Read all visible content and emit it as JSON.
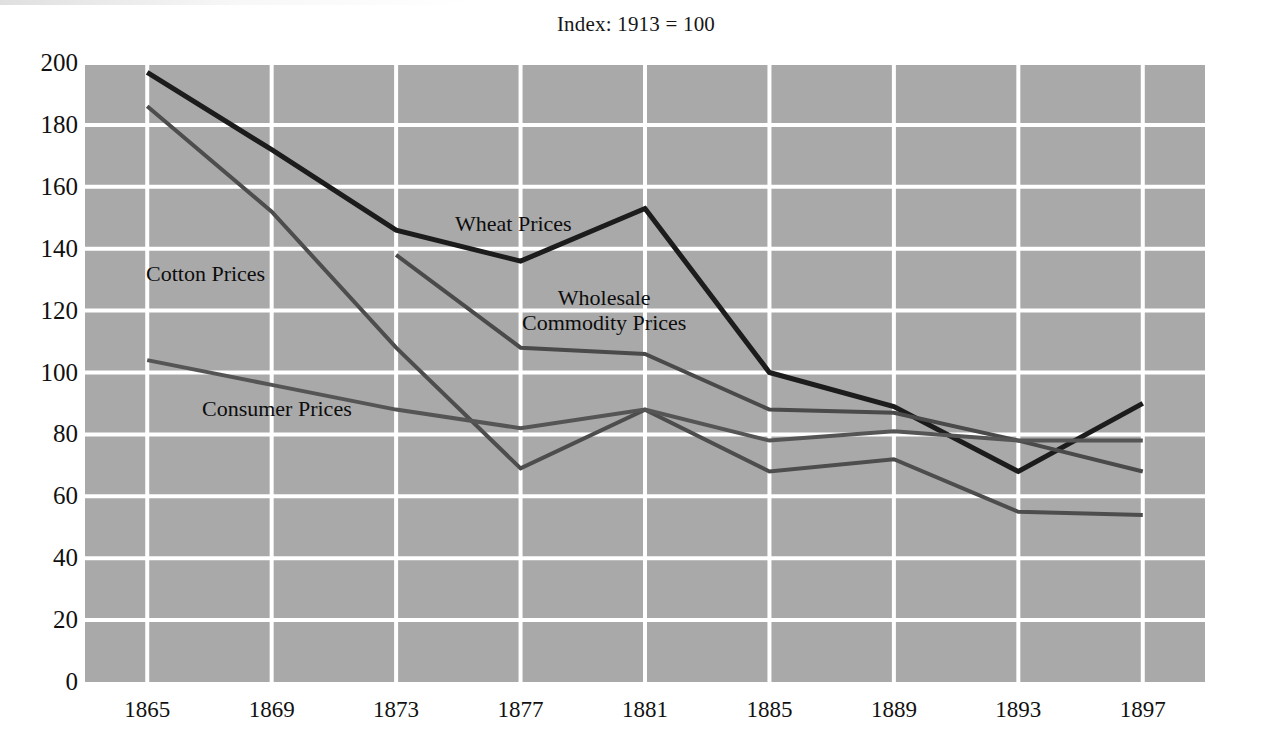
{
  "chart_data": {
    "type": "line",
    "title": "Index: 1913 = 100",
    "xlabel": "",
    "ylabel": "",
    "x": [
      1865,
      1869,
      1873,
      1877,
      1881,
      1885,
      1889,
      1893,
      1897
    ],
    "categories": [
      "1865",
      "1869",
      "1873",
      "1877",
      "1881",
      "1885",
      "1889",
      "1893",
      "1897"
    ],
    "xlim": [
      1863,
      1899
    ],
    "ylim": [
      0,
      200
    ],
    "yticks": [
      0,
      20,
      40,
      60,
      80,
      100,
      120,
      140,
      160,
      180,
      200
    ],
    "grid": true,
    "grid_color": "#ffffff",
    "plot_background": "#a9a9a9",
    "legend_position": "inline-annotations",
    "series": [
      {
        "name": "Wheat Prices",
        "color": "#1c1c1c",
        "width": 5,
        "values": [
          197,
          172,
          146,
          136,
          153,
          100,
          89,
          68,
          90
        ],
        "label_x": 455,
        "label_y": 212
      },
      {
        "name": "Cotton Prices",
        "color": "#4d4d4d",
        "width": 4,
        "values": [
          186,
          152,
          108,
          69,
          88,
          68,
          72,
          55,
          54
        ],
        "label_x": 146,
        "label_y": 262
      },
      {
        "name": "Wholesale\nCommodity Prices",
        "color": "#4a4a4a",
        "width": 4,
        "values": [
          null,
          null,
          138,
          108,
          106,
          88,
          87,
          78,
          68
        ],
        "label_x": 522,
        "label_y": 286
      },
      {
        "name": "Consumer Prices",
        "color": "#555555",
        "width": 4,
        "values": [
          104,
          96,
          88,
          82,
          88,
          78,
          81,
          78,
          78
        ],
        "label_x": 202,
        "label_y": 397
      }
    ]
  },
  "axes": {
    "plot_left": 85,
    "plot_right": 1205,
    "plot_top": 63,
    "plot_bottom": 682
  }
}
